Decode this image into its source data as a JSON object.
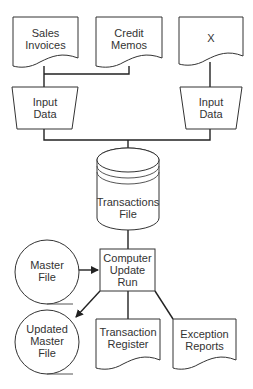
{
  "diagram": {
    "type": "system flowchart",
    "nodes": [
      {
        "id": "sales-invoices",
        "shape": "document",
        "label": "Sales\nInvoices"
      },
      {
        "id": "credit-memos",
        "shape": "document",
        "label": "Credit\nMemos"
      },
      {
        "id": "x-doc",
        "shape": "document",
        "label": "X"
      },
      {
        "id": "input-data-left",
        "shape": "manual-input",
        "label": "Input\nData"
      },
      {
        "id": "input-data-right",
        "shape": "manual-input",
        "label": "Input\nData"
      },
      {
        "id": "transactions-file",
        "shape": "disk",
        "label": "Transactions\nFile"
      },
      {
        "id": "master-file",
        "shape": "tape",
        "label": "Master\nFile"
      },
      {
        "id": "computer-update-run",
        "shape": "process",
        "label": "Computer\nUpdate\nRun"
      },
      {
        "id": "updated-master-file",
        "shape": "tape",
        "label": "Updated\nMaster\nFile"
      },
      {
        "id": "transaction-register",
        "shape": "document",
        "label": "Transaction\nRegister"
      },
      {
        "id": "exception-reports",
        "shape": "document",
        "label": "Exception\nReports"
      }
    ],
    "edges": [
      {
        "from": "sales-invoices",
        "to": "input-data-left"
      },
      {
        "from": "credit-memos",
        "to": "input-data-left"
      },
      {
        "from": "x-doc",
        "to": "input-data-right"
      },
      {
        "from": "input-data-left",
        "to": "transactions-file"
      },
      {
        "from": "input-data-right",
        "to": "transactions-file"
      },
      {
        "from": "transactions-file",
        "to": "computer-update-run"
      },
      {
        "from": "master-file",
        "to": "computer-update-run",
        "arrow": true
      },
      {
        "from": "computer-update-run",
        "to": "updated-master-file",
        "arrow": true
      },
      {
        "from": "computer-update-run",
        "to": "transaction-register"
      },
      {
        "from": "computer-update-run",
        "to": "exception-reports"
      }
    ]
  },
  "labels": {
    "sales_invoices": "Sales\nInvoices",
    "credit_memos": "Credit\nMemos",
    "x_doc": "X",
    "input_left": "Input\nData",
    "input_right": "Input\nData",
    "transactions_file": "Transactions\nFile",
    "master_file": "Master\nFile",
    "update_run": "Computer\nUpdate\nRun",
    "updated_master": "Updated\nMaster\nFile",
    "transaction_register": "Transaction\nRegister",
    "exception_reports": "Exception\nReports"
  }
}
